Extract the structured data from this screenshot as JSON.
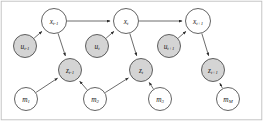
{
  "figure": {
    "width": 263,
    "height": 121,
    "background_color": "#ffffff",
    "border_color": "#bfbfbf"
  },
  "style": {
    "node_open_fill": "#ffffff",
    "node_shaded_fill": "#d4d4d4",
    "node_stroke": "#3b3b3b",
    "edge_color": "#3b3b3b",
    "label_color": "#1a1a1a"
  },
  "graph_data": {
    "type": "diagram",
    "node_rows": [
      {
        "row_name": "state-row",
        "description": "Latent robot pose / state variables",
        "shaded": false,
        "nodes": [
          {
            "id": "x_tm1",
            "base": "x",
            "sub": "t-1",
            "cx": 54,
            "cy": 21,
            "r": 12.5,
            "shaded": false
          },
          {
            "id": "x_t",
            "base": "x",
            "sub": "t",
            "cx": 126,
            "cy": 21,
            "r": 12.5,
            "shaded": false
          },
          {
            "id": "x_tp1",
            "base": "x",
            "sub": "t+1",
            "cx": 198,
            "cy": 21,
            "r": 12.5,
            "shaded": false
          }
        ]
      },
      {
        "row_name": "control-row",
        "description": "Control / odometry inputs",
        "shaded": true,
        "nodes": [
          {
            "id": "u_tm1",
            "base": "u",
            "sub": "t-1",
            "cx": 25,
            "cy": 46,
            "r": 11.5,
            "shaded": true
          },
          {
            "id": "u_t",
            "base": "u",
            "sub": "t",
            "cx": 97,
            "cy": 46,
            "r": 11.5,
            "shaded": true
          },
          {
            "id": "u_tp1",
            "base": "u",
            "sub": "t+1",
            "cx": 169,
            "cy": 46,
            "r": 11.5,
            "shaded": true
          }
        ]
      },
      {
        "row_name": "measurement-row",
        "description": "Observations / measurements",
        "shaded": true,
        "nodes": [
          {
            "id": "z_tm1",
            "base": "z",
            "sub": "t-1",
            "cx": 70,
            "cy": 70,
            "r": 11.5,
            "shaded": true
          },
          {
            "id": "z_t",
            "base": "z",
            "sub": "t",
            "cx": 141,
            "cy": 70,
            "r": 11.5,
            "shaded": true
          },
          {
            "id": "z_tp1",
            "base": "z",
            "sub": "t+1",
            "cx": 213,
            "cy": 70,
            "r": 11.5,
            "shaded": true
          }
        ]
      },
      {
        "row_name": "landmark-row",
        "description": "Map landmark variables",
        "shaded": false,
        "nodes": [
          {
            "id": "m_1",
            "base": "m",
            "sub": "1",
            "cx": 26,
            "cy": 99,
            "r": 11.5,
            "shaded": false
          },
          {
            "id": "m_2",
            "base": "m",
            "sub": "2",
            "cx": 95,
            "cy": 99,
            "r": 11.5,
            "shaded": false
          },
          {
            "id": "m_3",
            "base": "m",
            "sub": "3",
            "cx": 160,
            "cy": 99,
            "r": 11.5,
            "shaded": false
          },
          {
            "id": "m_M",
            "base": "m",
            "sub": "M",
            "cx": 228,
            "cy": 99,
            "r": 11.5,
            "shaded": false
          }
        ]
      }
    ],
    "edges": [
      {
        "from": "x_tm1",
        "to": "x_t",
        "label": "state-transition"
      },
      {
        "from": "x_t",
        "to": "x_tp1",
        "label": "state-transition"
      },
      {
        "from": "u_tm1",
        "to": "x_tm1",
        "label": "control-input"
      },
      {
        "from": "u_t",
        "to": "x_t",
        "label": "control-input"
      },
      {
        "from": "u_tp1",
        "to": "x_tp1",
        "label": "control-input"
      },
      {
        "from": "x_tm1",
        "to": "z_tm1",
        "label": "observation"
      },
      {
        "from": "x_t",
        "to": "z_t",
        "label": "observation"
      },
      {
        "from": "x_tp1",
        "to": "z_tp1",
        "label": "observation"
      },
      {
        "from": "m_1",
        "to": "z_tm1",
        "label": "landmark-observation"
      },
      {
        "from": "m_2",
        "to": "z_tm1",
        "label": "landmark-observation"
      },
      {
        "from": "m_2",
        "to": "z_t",
        "label": "landmark-observation"
      },
      {
        "from": "m_3",
        "to": "z_t",
        "label": "landmark-observation"
      },
      {
        "from": "m_M",
        "to": "z_tp1",
        "label": "landmark-observation"
      }
    ]
  }
}
